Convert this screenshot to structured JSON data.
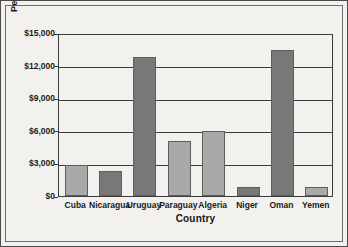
{
  "chart_data": {
    "type": "bar",
    "title": "",
    "xlabel": "Country",
    "ylabel": "Per capita GDP, 2003",
    "categories": [
      "Cuba",
      "Nicaragua",
      "Uruguay",
      "Paraguay",
      "Algeria",
      "Niger",
      "Oman",
      "Yemen"
    ],
    "values": [
      2900,
      2300,
      12800,
      5050,
      6000,
      830,
      13400,
      850
    ],
    "ylim": [
      0,
      15000
    ],
    "ytick_values": [
      0,
      3000,
      6000,
      9000,
      12000,
      15000
    ],
    "ytick_labels": [
      "$0",
      "$3,000",
      "$6,000",
      "$9,000",
      "$12,000",
      "$15,000"
    ],
    "grid": true,
    "legend": "none",
    "bar_shades": [
      "light",
      "dark",
      "dark",
      "light",
      "light",
      "dark",
      "dark",
      "light"
    ],
    "colors": {
      "bar_light": "#a9a9a9",
      "bar_dark": "#787878",
      "bar_edge": "#5e5e5e",
      "axis": "#3c3c3c",
      "background": "#f2f1ee",
      "text": "#1a1a1a"
    }
  }
}
